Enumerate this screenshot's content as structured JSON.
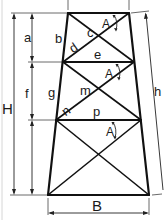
{
  "diagram": {
    "colors": {
      "line": "#111111",
      "background": "#ffffff"
    },
    "labels": {
      "H": "H",
      "a": "a",
      "f": "f",
      "b": "b",
      "c": "c",
      "d": "d",
      "e": "e",
      "g": "g",
      "m": "m",
      "n": "n",
      "p": "p",
      "h": "h",
      "B": "B",
      "angle_1": "A",
      "angle_2": "A",
      "angle_3": "A"
    },
    "dimensions": [
      {
        "name": "H",
        "meaning": "total height"
      },
      {
        "name": "a",
        "meaning": "top panel height"
      },
      {
        "name": "f",
        "meaning": "middle panel height"
      },
      {
        "name": "h",
        "meaning": "inclined leg length"
      },
      {
        "name": "B",
        "meaning": "base width"
      }
    ],
    "members": [
      {
        "name": "b",
        "type": "leg segment"
      },
      {
        "name": "c",
        "type": "bracing intersection"
      },
      {
        "name": "d",
        "type": "diagonal"
      },
      {
        "name": "e",
        "type": "horizontal strut"
      },
      {
        "name": "g",
        "type": "leg segment"
      },
      {
        "name": "m",
        "type": "bracing intersection"
      },
      {
        "name": "n",
        "type": "diagonal"
      },
      {
        "name": "p",
        "type": "horizontal strut"
      }
    ],
    "panels": 3
  }
}
